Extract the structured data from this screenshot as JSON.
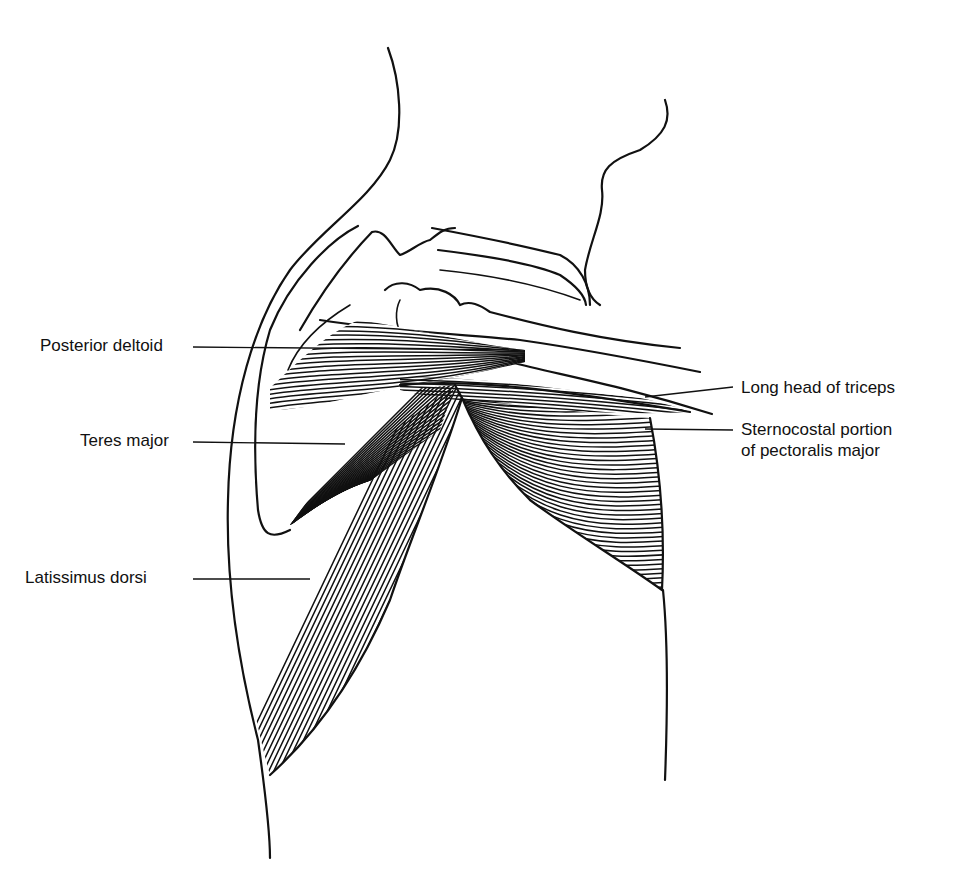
{
  "figure": {
    "type": "anatomical line illustration",
    "colors": {
      "ink": "#111111",
      "background": "#ffffff"
    }
  },
  "labels": {
    "left": [
      {
        "id": "posterior-deltoid",
        "text": "Posterior deltoid"
      },
      {
        "id": "teres-major",
        "text": "Teres major"
      },
      {
        "id": "latissimus-dorsi",
        "text": "Latissimus dorsi"
      }
    ],
    "right": [
      {
        "id": "long-head-triceps",
        "text": "Long head of triceps"
      },
      {
        "id": "sternocostal-pectoralis",
        "line1": "Sternocostal portion",
        "line2": "of pectoralis major"
      }
    ]
  }
}
